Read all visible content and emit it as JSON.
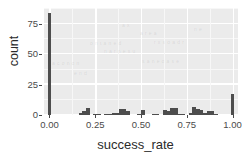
{
  "chart_data": {
    "type": "bar",
    "subtype": "histogram",
    "title": "",
    "subtitle": "",
    "xlabel": "success_rate",
    "ylabel": "count",
    "xlim": [
      -0.03,
      1.03
    ],
    "ylim": [
      0,
      88
    ],
    "binwidth": 0.02,
    "grid": true,
    "legend": false,
    "legend_position": "none",
    "xticks": [
      "0.00",
      "0.25",
      "0.50",
      "0.75",
      "1.00"
    ],
    "xtick_values": [
      0.0,
      0.25,
      0.5,
      0.75,
      1.0
    ],
    "yticks": [
      "0",
      "25",
      "50",
      "75"
    ],
    "ytick_values": [
      0,
      25,
      50,
      75
    ],
    "bar_color": "#4d4d4d",
    "panel_color": "#ebebeb",
    "grid_color": "#ffffff",
    "x": [
      0.0,
      0.17,
      0.19,
      0.21,
      0.25,
      0.27,
      0.31,
      0.33,
      0.35,
      0.37,
      0.39,
      0.41,
      0.43,
      0.49,
      0.51,
      0.57,
      0.59,
      0.63,
      0.65,
      0.67,
      0.69,
      0.71,
      0.73,
      0.77,
      0.79,
      0.81,
      0.83,
      0.85,
      0.87,
      0.89,
      0.91,
      1.0
    ],
    "values": [
      84,
      2,
      3,
      6,
      1,
      1,
      1,
      1,
      2,
      2,
      5,
      5,
      3,
      1,
      4,
      1,
      1,
      4,
      3,
      6,
      6,
      1,
      1,
      2,
      7,
      5,
      4,
      2,
      3,
      3,
      1,
      17
    ],
    "categories": [
      "0.00",
      "0.17",
      "0.19",
      "0.21",
      "0.25",
      "0.27",
      "0.31",
      "0.33",
      "0.35",
      "0.37",
      "0.39",
      "0.41",
      "0.43",
      "0.49",
      "0.51",
      "0.57",
      "0.59",
      "0.63",
      "0.65",
      "0.67",
      "0.69",
      "0.71",
      "0.73",
      "0.77",
      "0.79",
      "0.81",
      "0.83",
      "0.85",
      "0.87",
      "0.89",
      "0.91",
      "1.00"
    ]
  }
}
